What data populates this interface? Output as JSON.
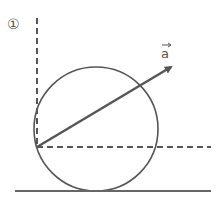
{
  "figure": {
    "marker": "①",
    "vector_label": "a",
    "colors": {
      "stroke": "#555555",
      "ground": "#666666",
      "background": "#ffffff"
    },
    "geometry": {
      "origin": [
        37,
        147
      ],
      "circle_center": [
        96,
        129
      ],
      "circle_radius": 62,
      "vector_tip": [
        173,
        66
      ],
      "dashed_vertical": {
        "x": 37,
        "y_top": 18,
        "y_bottom": 147
      },
      "dashed_horizontal": {
        "y": 147,
        "x_start": 37,
        "x_end": 211
      },
      "ground_line": {
        "y": 191,
        "x_start": 15,
        "x_end": 211
      }
    }
  }
}
